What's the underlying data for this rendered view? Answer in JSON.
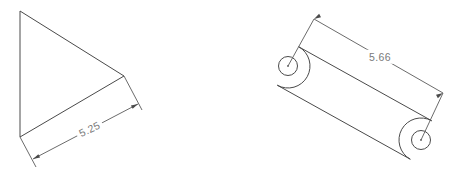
{
  "drawing": {
    "title": "CAD Technical Drawing",
    "background_color": "#ffffff",
    "line_color": "#4a4a4a",
    "dimension_color": "#5a5a5a",
    "text_color": "#7a7a7a",
    "views": [
      {
        "name": "triangular-plate-view",
        "shape_type": "triangle",
        "vertices": [
          {
            "x": 20,
            "y": 11
          },
          {
            "x": 124,
            "y": 76
          },
          {
            "x": 20,
            "y": 137
          }
        ],
        "dimension": {
          "name": "triangle-length-dimension",
          "value": "5.25",
          "label_x": 90,
          "label_y": 130,
          "label_rotation": -26,
          "line_start": {
            "x": 33,
            "y": 159
          },
          "line_end": {
            "x": 138,
            "y": 104
          },
          "ext_from_a": {
            "x": 20,
            "y": 137
          },
          "ext_to_a": {
            "x": 36,
            "y": 167
          },
          "ext_from_b": {
            "x": 124,
            "y": 76
          },
          "ext_to_b": {
            "x": 142,
            "y": 110
          },
          "arrow_a_angle": 153,
          "arrow_b_angle": -27
        }
      },
      {
        "name": "slotted-link-view",
        "shape_type": "slotted-link",
        "hole_left": {
          "cx": 288,
          "cy": 66,
          "r": 9.5
        },
        "hole_right": {
          "cx": 421,
          "cy": 140,
          "r": 9.5
        },
        "outline_radius": 22,
        "dimension": {
          "name": "hole-center-distance-dimension",
          "value": "5.66",
          "label_x": 380,
          "label_y": 58,
          "label_rotation": 0,
          "line_start": {
            "x": 314,
            "y": 19
          },
          "line_end": {
            "x": 443,
            "y": 93
          },
          "ext_from_a": {
            "x": 288,
            "y": 66
          },
          "ext_to_a": {
            "x": 314,
            "y": 19
          },
          "ext_from_b": {
            "x": 421,
            "y": 140
          },
          "ext_to_b": {
            "x": 443,
            "y": 93
          },
          "arrow_a_angle": 150,
          "arrow_b_angle": -30
        }
      }
    ]
  }
}
